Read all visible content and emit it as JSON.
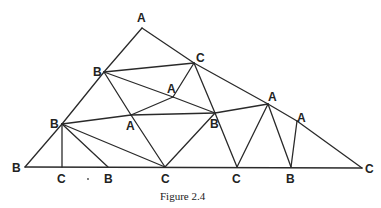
{
  "figure": {
    "caption": "Figure 2.4",
    "vertices": [
      {
        "id": "v1",
        "label": "A",
        "x": 142,
        "y": 28,
        "lx": 137,
        "ly": 22
      },
      {
        "id": "v2",
        "label": "B",
        "x": 104,
        "y": 72,
        "lx": 93,
        "ly": 76
      },
      {
        "id": "v3",
        "label": "C",
        "x": 194,
        "y": 63,
        "lx": 196,
        "ly": 62
      },
      {
        "id": "v4",
        "label": "A",
        "x": 173,
        "y": 97,
        "lx": 167,
        "ly": 93
      },
      {
        "id": "v5",
        "label": "A",
        "x": 131,
        "y": 115,
        "lx": 126,
        "ly": 130
      },
      {
        "id": "v6",
        "label": "B",
        "x": 215,
        "y": 113,
        "lx": 210,
        "ly": 128
      },
      {
        "id": "v7",
        "label": "A",
        "x": 268,
        "y": 104,
        "lx": 268,
        "ly": 101
      },
      {
        "id": "v8",
        "label": "A",
        "x": 297,
        "y": 121,
        "lx": 297,
        "ly": 122
      },
      {
        "id": "v9",
        "label": "B",
        "x": 62,
        "y": 124,
        "lx": 50,
        "ly": 128
      },
      {
        "id": "v10",
        "label": "B",
        "x": 25,
        "y": 167,
        "lx": 12,
        "ly": 172
      },
      {
        "id": "v11",
        "label": "C",
        "x": 62,
        "y": 167,
        "lx": 57,
        "ly": 183
      },
      {
        "id": "v12",
        "label": "B",
        "x": 108,
        "y": 167,
        "lx": 104,
        "ly": 183
      },
      {
        "id": "v13",
        "label": "C",
        "x": 165,
        "y": 167,
        "lx": 161,
        "ly": 183
      },
      {
        "id": "v14",
        "label": "C",
        "x": 237,
        "y": 167,
        "lx": 232,
        "ly": 183
      },
      {
        "id": "v15",
        "label": "B",
        "x": 291,
        "y": 167,
        "lx": 286,
        "ly": 183
      },
      {
        "id": "v16",
        "label": "C",
        "x": 362,
        "y": 168,
        "lx": 365,
        "ly": 173
      }
    ],
    "edges": [
      [
        "v1",
        "v2"
      ],
      [
        "v2",
        "v9"
      ],
      [
        "v9",
        "v10"
      ],
      [
        "v1",
        "v3"
      ],
      [
        "v3",
        "v7"
      ],
      [
        "v7",
        "v8"
      ],
      [
        "v8",
        "v16"
      ],
      [
        "v10",
        "v16"
      ],
      [
        "v2",
        "v3"
      ],
      [
        "v2",
        "v4"
      ],
      [
        "v4",
        "v6"
      ],
      [
        "v4",
        "v3"
      ],
      [
        "v4",
        "v5"
      ],
      [
        "v2",
        "v5"
      ],
      [
        "v5",
        "v13"
      ],
      [
        "v9",
        "v5"
      ],
      [
        "v5",
        "v6"
      ],
      [
        "v9",
        "v11"
      ],
      [
        "v9",
        "v12"
      ],
      [
        "v9",
        "v13"
      ],
      [
        "v3",
        "v6"
      ],
      [
        "v6",
        "v14"
      ],
      [
        "v6",
        "v13"
      ],
      [
        "v6",
        "v7"
      ],
      [
        "v7",
        "v14"
      ],
      [
        "v7",
        "v15"
      ],
      [
        "v8",
        "v15"
      ]
    ],
    "stray_mark": {
      "x": 88,
      "y": 179
    }
  }
}
